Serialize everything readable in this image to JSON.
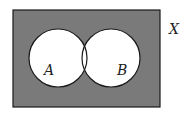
{
  "diagram": {
    "type": "venn",
    "universe_label": "X",
    "sets": [
      {
        "label": "A"
      },
      {
        "label": "B"
      }
    ],
    "colors": {
      "shaded": "#7a7a7a",
      "unshaded": "#ffffff",
      "stroke": "#1a1a1a"
    },
    "shaded_region": "complement of A union B"
  }
}
